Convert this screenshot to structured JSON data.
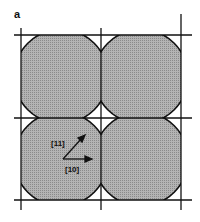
{
  "figure": {
    "panel_label": "a",
    "vectors": [
      {
        "label": "[11]",
        "direction": "diagonal"
      },
      {
        "label": "[10]",
        "direction": "horizontal"
      }
    ],
    "grid": {
      "rows": 2,
      "cols": 2
    },
    "colors": {
      "fill": "#a8a8a8",
      "line": "#111111",
      "background": "#ffffff"
    }
  }
}
